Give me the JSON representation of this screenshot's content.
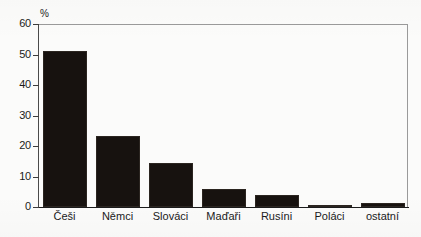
{
  "chart_data": {
    "type": "bar",
    "title": "",
    "subtitle": "",
    "xlabel": "",
    "ylabel": "%",
    "unit_label": "%",
    "categories": [
      "Češi",
      "Němci",
      "Slováci",
      "Maďaři",
      "Rusíni",
      "Poláci",
      "ostatní"
    ],
    "values": [
      51.0,
      23.4,
      14.4,
      5.8,
      3.8,
      0.6,
      1.3
    ],
    "ylim": [
      0,
      60
    ],
    "ytick_values": [
      0,
      10,
      20,
      30,
      40,
      50,
      60
    ],
    "ytick_labels": [
      "0",
      "10",
      "20",
      "30",
      "40",
      "50",
      "60"
    ],
    "grid": false,
    "legend": false,
    "legend_position": "none",
    "bar_color": "#17120f",
    "axis_color": "#1a1a1a",
    "frame_color": "#9a9a9a",
    "background_color": "#fbfbfa"
  }
}
